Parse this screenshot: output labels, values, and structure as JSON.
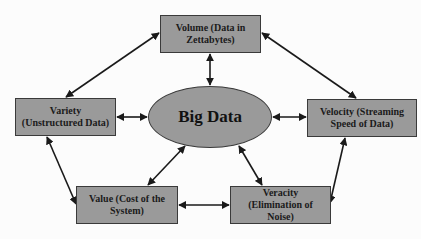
{
  "diagram": {
    "center": {
      "label": "Big Data"
    },
    "nodes": {
      "volume": {
        "label": "Volume (Data in Zettabytes)"
      },
      "variety": {
        "label": "Variety (Unstructured Data)"
      },
      "velocity": {
        "label": "Velocity (Streaming Speed of Data)"
      },
      "value": {
        "label": "Value (Cost of the System)"
      },
      "veracity": {
        "label": "Veracity (Elimination of Noise)"
      }
    },
    "edges": [
      {
        "from": "volume",
        "to": "big-data",
        "type": "bidirectional"
      },
      {
        "from": "volume",
        "to": "variety",
        "type": "bidirectional"
      },
      {
        "from": "volume",
        "to": "velocity",
        "type": "bidirectional"
      },
      {
        "from": "variety",
        "to": "big-data",
        "type": "bidirectional"
      },
      {
        "from": "big-data",
        "to": "velocity",
        "type": "bidirectional"
      },
      {
        "from": "variety",
        "to": "value",
        "type": "bidirectional"
      },
      {
        "from": "big-data",
        "to": "value",
        "type": "bidirectional"
      },
      {
        "from": "big-data",
        "to": "veracity",
        "type": "bidirectional"
      },
      {
        "from": "veracity",
        "to": "velocity",
        "type": "bidirectional"
      },
      {
        "from": "value",
        "to": "veracity",
        "type": "bidirectional"
      }
    ],
    "colors": {
      "node_fill": "#9a9a9a",
      "node_border": "#3a3a3a",
      "arrow": "#1a1a1a",
      "text": "#1a1a1a"
    }
  }
}
